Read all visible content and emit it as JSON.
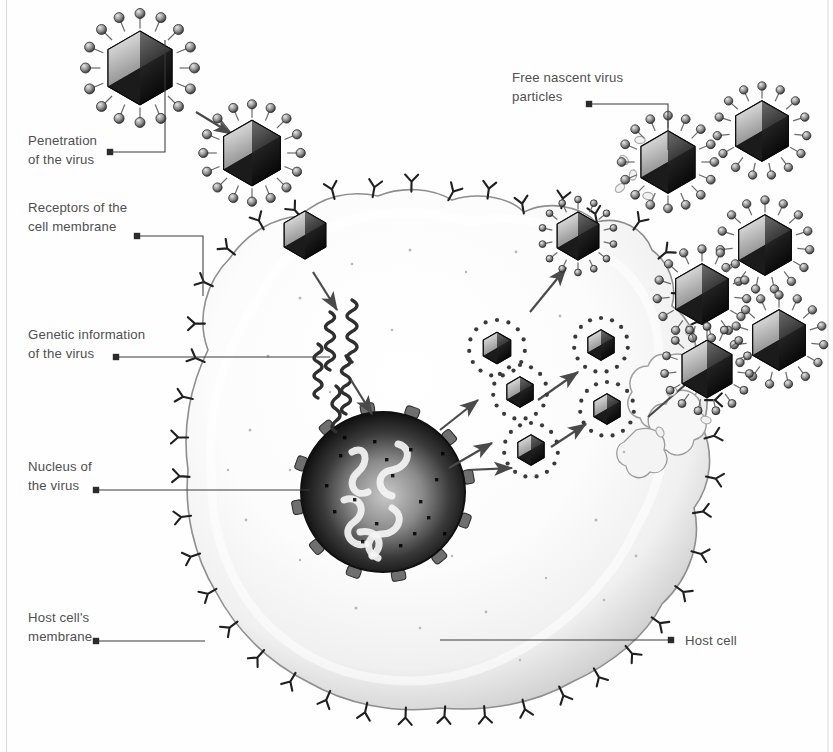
{
  "figure": {
    "background_color": "#fefefe",
    "label_color": "#4f4f4f",
    "leader_color": "#3a3a3a"
  },
  "labels": [
    {
      "id": "penetration",
      "name": "label-penetration-of-the-virus",
      "line1": "Penetration",
      "line2": "of the virus",
      "x": 28,
      "y": 145,
      "dot_x": 110,
      "dot_y": 152,
      "leader": "M110,152 H165 V40",
      "align": "left"
    },
    {
      "id": "receptors",
      "name": "label-receptors-of-the-cell-membrane",
      "line1": "Receptors of the",
      "line2": "cell membrane",
      "x": 28,
      "y": 212,
      "dot_x": 137,
      "dot_y": 236,
      "leader": "M137,236 H203 V296",
      "align": "left"
    },
    {
      "id": "genetic",
      "name": "label-genetic-information-of-the-virus",
      "line1": "Genetic information",
      "line2": "of the virus",
      "x": 28,
      "y": 339,
      "dot_x": 116,
      "dot_y": 357,
      "leader": "M116,357 H330",
      "align": "left"
    },
    {
      "id": "nucleus",
      "name": "label-nucleus-of-the-virus",
      "line1": "Nucleus of",
      "line2": "the virus",
      "x": 28,
      "y": 471,
      "dot_x": 96,
      "dot_y": 490,
      "leader": "M96,490 H310",
      "align": "left"
    },
    {
      "id": "hostmembrane",
      "name": "label-host-cells-membrane",
      "line1": "Host cell's",
      "line2": "membrane",
      "x": 28,
      "y": 622,
      "dot_x": 96,
      "dot_y": 641,
      "leader": "M96,641 H205",
      "align": "left"
    },
    {
      "id": "freenascent",
      "name": "label-free-nascent-virus-particles",
      "line1": "Free nascent virus",
      "line2": "particles",
      "x": 512,
      "y": 82,
      "dot_x": 589,
      "dot_y": 104,
      "leader": "M589,104 H668 V150",
      "align": "left"
    },
    {
      "id": "hostcell",
      "name": "label-host-cell",
      "line1": "Host cell",
      "line2": "",
      "x": 685,
      "y": 645,
      "dot_x": 671,
      "dot_y": 640,
      "leader": "M671,640 H440",
      "align": "left"
    }
  ],
  "virions": {
    "outside_spiked": [
      {
        "name": "virion-incoming-1",
        "cx": 140,
        "cy": 68,
        "r": 45,
        "spikes": 16,
        "knob": 5.0
      },
      {
        "name": "virion-incoming-2",
        "cx": 252,
        "cy": 153,
        "r": 40,
        "spikes": 16,
        "knob": 4.6
      },
      {
        "name": "virion-released-1",
        "cx": 668,
        "cy": 162,
        "r": 38,
        "spikes": 16,
        "knob": 4.4
      },
      {
        "name": "virion-released-2",
        "cx": 762,
        "cy": 131,
        "r": 37,
        "spikes": 15,
        "knob": 4.2
      },
      {
        "name": "virion-released-3",
        "cx": 765,
        "cy": 245,
        "r": 37,
        "spikes": 15,
        "knob": 4.2
      },
      {
        "name": "virion-released-4",
        "cx": 702,
        "cy": 294,
        "r": 37,
        "spikes": 15,
        "knob": 4.2
      },
      {
        "name": "virion-released-5",
        "cx": 779,
        "cy": 340,
        "r": 37,
        "spikes": 15,
        "knob": 4.2
      },
      {
        "name": "virion-released-6",
        "cx": 707,
        "cy": 369,
        "r": 35,
        "spikes": 15,
        "knob": 4.0
      }
    ],
    "budding": [
      {
        "name": "virion-budding-membrane",
        "cx": 578,
        "cy": 236,
        "r": 30,
        "spikes": 14,
        "knob": 3.4
      }
    ],
    "interior_dotted": [
      {
        "name": "virion-assembly-1",
        "cx": 497,
        "cy": 348,
        "r": 24,
        "spikes": 15,
        "knob": 2.1
      },
      {
        "name": "virion-assembly-2",
        "cx": 520,
        "cy": 392,
        "r": 23,
        "spikes": 15,
        "knob": 2.1
      },
      {
        "name": "virion-assembly-3",
        "cx": 531,
        "cy": 450,
        "r": 23,
        "spikes": 15,
        "knob": 2.1
      },
      {
        "name": "virion-assembly-4",
        "cx": 601,
        "cy": 345,
        "r": 23,
        "spikes": 15,
        "knob": 2.1
      },
      {
        "name": "virion-assembly-5",
        "cx": 607,
        "cy": 409,
        "r": 23,
        "spikes": 15,
        "knob": 2.1
      }
    ],
    "naked_capsid": [
      {
        "name": "capsid-entered-cell",
        "cx": 305,
        "cy": 235,
        "r": 24
      }
    ]
  },
  "arrows": [
    {
      "name": "arrow-virus-approach",
      "from": [
        196,
        112
      ],
      "to": [
        232,
        134
      ]
    },
    {
      "name": "arrow-uncoating",
      "from": [
        313,
        272
      ],
      "to": [
        337,
        310
      ]
    },
    {
      "name": "arrow-genome-to-nucleus",
      "from": [
        351,
        380
      ],
      "to": [
        372,
        414
      ]
    },
    {
      "name": "arrow-assembly-1",
      "from": [
        440,
        430
      ],
      "to": [
        478,
        400
      ]
    },
    {
      "name": "arrow-assembly-2",
      "from": [
        449,
        468
      ],
      "to": [
        492,
        443
      ]
    },
    {
      "name": "arrow-assembly-3",
      "from": [
        468,
        470
      ],
      "to": [
        512,
        468
      ]
    },
    {
      "name": "arrow-assembly-4",
      "from": [
        538,
        400
      ],
      "to": [
        578,
        372
      ]
    },
    {
      "name": "arrow-assembly-5",
      "from": [
        551,
        447
      ],
      "to": [
        586,
        424
      ]
    },
    {
      "name": "arrow-to-budding",
      "from": [
        530,
        312
      ],
      "to": [
        566,
        268
      ]
    },
    {
      "name": "arrow-release-pseudopod",
      "from": [
        648,
        417
      ],
      "to": [
        700,
        372
      ]
    }
  ],
  "cell": {
    "name": "host-cell-body",
    "receptor_count": 44,
    "nucleus": {
      "name": "cell-nucleus",
      "cx": 383,
      "cy": 492,
      "rx": 84,
      "ry": 82
    },
    "genome_strands": 5
  },
  "debris": [
    {
      "cx": 640,
      "cy": 140
    },
    {
      "cx": 624,
      "cy": 160
    },
    {
      "cx": 633,
      "cy": 175
    },
    {
      "cx": 620,
      "cy": 188
    },
    {
      "cx": 648,
      "cy": 196
    },
    {
      "cx": 662,
      "cy": 142
    },
    {
      "cx": 689,
      "cy": 330
    },
    {
      "cx": 672,
      "cy": 392
    },
    {
      "cx": 706,
      "cy": 420
    },
    {
      "cx": 660,
      "cy": 432
    }
  ]
}
